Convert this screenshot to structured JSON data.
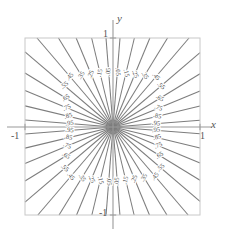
{
  "figure": {
    "name": "contour-plot",
    "background": "#ffffff",
    "frame": {
      "x0": 25,
      "y0": 38,
      "x1": 200,
      "y1": 215,
      "color": "#c8c8c8",
      "line_width": 1
    },
    "axes": {
      "x_axis_label": "x",
      "y_axis_label": "y",
      "x_axis_pixel_y": 127,
      "y_axis_pixel_x": 113,
      "axis_color": "#9a9a9a",
      "ticks": {
        "x_positive": "1",
        "x_negative": "-1",
        "y_positive": "1",
        "y_negative": "-1"
      }
    },
    "contour_style": {
      "color": "#7d7d7d",
      "line_width": 1.05,
      "label_color": "#4a4a4a",
      "label_font_size": 6.5
    }
  },
  "chart_data": {
    "type": "line",
    "title": "",
    "subtitle": "",
    "xlabel": "x",
    "ylabel": "y",
    "xlim": [
      -1,
      1
    ],
    "ylim": [
      -1,
      1
    ],
    "xticks": [
      -1,
      1
    ],
    "yticks": [
      -1,
      1
    ],
    "xticklabels": [
      "-1",
      "1"
    ],
    "yticklabels": [
      "-1",
      "1"
    ],
    "grid": false,
    "legend": null,
    "contour_levels": [
      0.05,
      0.15,
      0.25,
      0.35,
      0.45,
      0.55,
      0.65,
      0.75,
      0.85,
      0.95
    ],
    "contour_level_labels": [
      ".05",
      ".15",
      ".25",
      ".35",
      ".45",
      ".55",
      ".65",
      ".75",
      ".85",
      ".95"
    ],
    "series": [
      {
        "name": ".05",
        "level": 0.05,
        "ray_angle_deg": 85.5
      },
      {
        "name": ".15",
        "level": 0.15,
        "ray_angle_deg": 76.5
      },
      {
        "name": ".25",
        "level": 0.25,
        "ray_angle_deg": 67.5
      },
      {
        "name": ".35",
        "level": 0.35,
        "ray_angle_deg": 58.5
      },
      {
        "name": ".45",
        "level": 0.45,
        "ray_angle_deg": 49.5
      },
      {
        "name": ".55",
        "level": 0.55,
        "ray_angle_deg": 40.5
      },
      {
        "name": ".65",
        "level": 0.65,
        "ray_angle_deg": 31.5
      },
      {
        "name": ".75",
        "level": 0.75,
        "ray_angle_deg": 22.5
      },
      {
        "name": ".85",
        "level": 0.85,
        "ray_angle_deg": 13.5
      },
      {
        "name": ".95",
        "level": 0.95,
        "ray_angle_deg": 4.5
      }
    ],
    "quadrant_labels": {
      "top_right": [
        ".05",
        ".15",
        ".25",
        ".35",
        ".45",
        ".55",
        ".65",
        ".75",
        ".85",
        ".95"
      ],
      "top_left": [
        ".05",
        ".15",
        ".25",
        ".35",
        ".45",
        ".55",
        ".65",
        ".75",
        ".85",
        ".95"
      ],
      "bottom_left": [
        ".05",
        ".15",
        ".25",
        ".35",
        ".45",
        ".55",
        ".65",
        ".75",
        ".85",
        ".95"
      ],
      "bottom_right": [
        ".05",
        ".15",
        ".25",
        ".35",
        ".45",
        ".55",
        ".65",
        ".75",
        ".85",
        ".95"
      ]
    }
  }
}
